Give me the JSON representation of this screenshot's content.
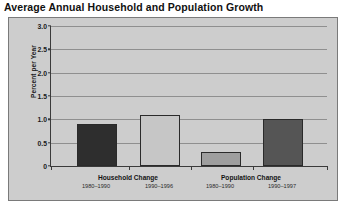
{
  "chart_data": {
    "type": "bar",
    "title": "Average Annual Household and Population Growth",
    "xlabel": "",
    "ylabel": "Percent per Year",
    "ylim": [
      0,
      3.0
    ],
    "ytick_labels": [
      "0",
      "0.5",
      "1.0",
      "1.5",
      "2.0",
      "2.5",
      "3.0"
    ],
    "ytick_values": [
      0,
      0.5,
      1.0,
      1.5,
      2.0,
      2.5,
      3.0
    ],
    "grid": true,
    "legend": "none",
    "groups": [
      {
        "label": "Household Change",
        "bars": [
          {
            "label": "1980–1990",
            "value": 0.9,
            "color": "#2e2e2e"
          },
          {
            "label": "1990–1996",
            "value": 1.1,
            "color": "#c6c6c6"
          }
        ]
      },
      {
        "label": "Population Change",
        "bars": [
          {
            "label": "1980–1990",
            "value": 0.3,
            "color": "#9e9e9e"
          },
          {
            "label": "1990–1997",
            "value": 1.0,
            "color": "#555555"
          }
        ]
      }
    ],
    "categories": [
      "Household Change 1980–1990",
      "Household Change 1990–1996",
      "Population Change 1980–1990",
      "Population Change 1990–1997"
    ],
    "values": [
      0.9,
      1.1,
      0.3,
      1.0
    ]
  }
}
